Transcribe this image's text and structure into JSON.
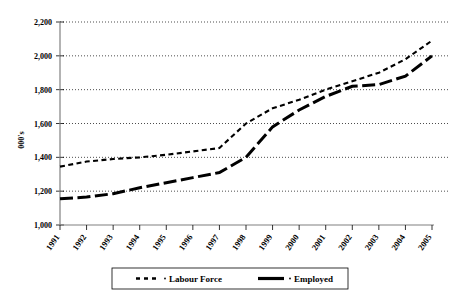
{
  "chart_data": {
    "type": "line",
    "title": "",
    "xlabel": "",
    "ylabel": "000's",
    "ylim": [
      1000,
      2200
    ],
    "ytick_step": 200,
    "grid": true,
    "legend_position": "bottom",
    "categories": [
      "1991",
      "1992",
      "1993",
      "1994",
      "1995",
      "1996",
      "1997",
      "1998",
      "1999",
      "2000",
      "2001",
      "2002",
      "2003",
      "2004",
      "2005"
    ],
    "ytick_labels": [
      "1,000",
      "1,200",
      "1,400",
      "1,600",
      "1,800",
      "2,000",
      "2,200"
    ],
    "ytick_values": [
      1000,
      1200,
      1400,
      1600,
      1800,
      2000,
      2200
    ],
    "series": [
      {
        "name": "Labour Force",
        "style": "dashed",
        "values": [
          1345,
          1375,
          1390,
          1400,
          1415,
          1435,
          1455,
          1600,
          1690,
          1740,
          1800,
          1850,
          1900,
          1980,
          2090
        ]
      },
      {
        "name": "Employed",
        "style": "solid",
        "values": [
          1155,
          1165,
          1185,
          1220,
          1250,
          1280,
          1310,
          1400,
          1580,
          1680,
          1760,
          1820,
          1830,
          1880,
          2000
        ]
      }
    ],
    "legend": [
      {
        "label": "Labour Force",
        "style": "dashed"
      },
      {
        "label": "Employed",
        "style": "solid"
      }
    ]
  }
}
